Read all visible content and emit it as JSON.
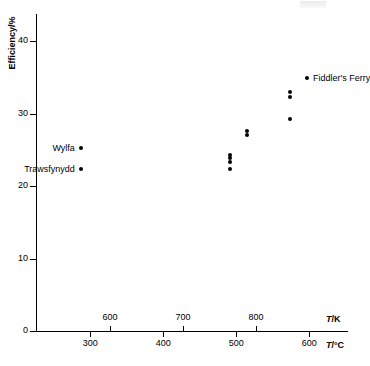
{
  "chart_data": {
    "type": "scatter",
    "title": "",
    "xlabel": "T /K",
    "xlabel_secondary": "T /°C",
    "ylabel": "Efficiency/%",
    "ylim": [
      0,
      43.8
    ],
    "yticks": [
      0,
      10,
      20,
      30,
      40
    ],
    "xlim_kelvin": [
      510,
      910
    ],
    "xticks_kelvin": [
      600,
      700,
      800
    ],
    "xlim_celsius": [
      237,
      637
    ],
    "xticks_celsius": [
      300,
      400,
      500,
      600
    ],
    "grid": false,
    "legend": "none",
    "points": [
      {
        "name": "Trawsfynydd",
        "t_k": 560,
        "efficiency": 22.3,
        "labelled": true
      },
      {
        "name": "Wylfa",
        "t_k": 560,
        "efficiency": 25.2,
        "labelled": true
      },
      {
        "name": "",
        "t_k": 765,
        "efficiency": 22.3,
        "labelled": false
      },
      {
        "name": "",
        "t_k": 765,
        "efficiency": 23.3,
        "labelled": false
      },
      {
        "name": "",
        "t_k": 765,
        "efficiency": 23.9,
        "labelled": false
      },
      {
        "name": "",
        "t_k": 765,
        "efficiency": 24.3,
        "labelled": false
      },
      {
        "name": "",
        "t_k": 788,
        "efficiency": 27.0,
        "labelled": false
      },
      {
        "name": "",
        "t_k": 788,
        "efficiency": 27.6,
        "labelled": false
      },
      {
        "name": "",
        "t_k": 847,
        "efficiency": 29.3,
        "labelled": false
      },
      {
        "name": "",
        "t_k": 847,
        "efficiency": 32.3,
        "labelled": false
      },
      {
        "name": "",
        "t_k": 847,
        "efficiency": 32.9,
        "labelled": false
      },
      {
        "name": "Fiddler's Ferry",
        "t_k": 870,
        "efficiency": 34.9,
        "labelled": true
      }
    ]
  },
  "axes": {
    "y": {
      "title": "Efficiency/%",
      "ticks": [
        {
          "label": "40",
          "value": 40
        },
        {
          "label": "30",
          "value": 30
        },
        {
          "label": "20",
          "value": 20
        },
        {
          "label": "10",
          "value": 10
        },
        {
          "label": "0",
          "value": 0
        }
      ]
    },
    "x_kelvin": {
      "symbol": "T",
      "unit": "/K",
      "ticks": [
        {
          "label": "600",
          "value": 600
        },
        {
          "label": "700",
          "value": 700
        },
        {
          "label": "800",
          "value": 800
        }
      ]
    },
    "x_celsius": {
      "symbol": "T",
      "unit": "/°C",
      "ticks": [
        {
          "label": "300",
          "value": 300
        },
        {
          "label": "400",
          "value": 400
        },
        {
          "label": "500",
          "value": 500
        },
        {
          "label": "600",
          "value": 600
        }
      ]
    }
  },
  "annotations": [
    {
      "text": "Wylfa",
      "anchor": "left-of-marker"
    },
    {
      "text": "Trawsfynydd",
      "anchor": "left-of-marker"
    },
    {
      "text": "Fiddler's Ferry",
      "anchor": "right-of-marker"
    }
  ]
}
